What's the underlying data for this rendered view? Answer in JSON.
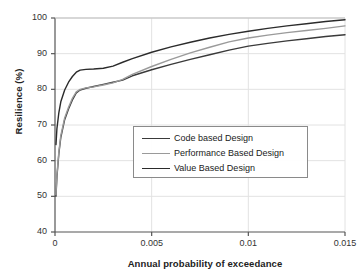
{
  "chart_data": {
    "type": "line",
    "title": "",
    "xlabel": "Annual probability of exceedance",
    "ylabel": "Resilience (%)",
    "xlim": [
      0,
      0.015
    ],
    "ylim": [
      40,
      100
    ],
    "xticks": [
      "0",
      "0.005",
      "0.01",
      "0.015"
    ],
    "xtick_values": [
      0,
      0.005,
      0.01,
      0.015
    ],
    "yticks": [
      "40",
      "50",
      "60",
      "70",
      "80",
      "90",
      "100"
    ],
    "ytick_values": [
      40,
      50,
      60,
      70,
      80,
      90,
      100
    ],
    "grid": true,
    "legend_position": "center",
    "series": [
      {
        "name": "Code based Design",
        "color": "#3a3a3a",
        "x": [
          5e-05,
          0.0001,
          0.0002,
          0.0003,
          0.0005,
          0.0007,
          0.0009,
          0.0011,
          0.0013,
          0.0016,
          0.002,
          0.0025,
          0.003,
          0.0035,
          0.004,
          0.005,
          0.006,
          0.007,
          0.008,
          0.009,
          0.01,
          0.011,
          0.012,
          0.013,
          0.014,
          0.015
        ],
        "y": [
          50.0,
          55.5,
          62.0,
          66.5,
          71.5,
          74.5,
          77.0,
          79.0,
          79.8,
          80.3,
          80.8,
          81.4,
          82.0,
          82.6,
          83.8,
          85.5,
          87.0,
          88.4,
          89.7,
          91.0,
          92.1,
          92.9,
          93.6,
          94.2,
          94.8,
          95.3
        ]
      },
      {
        "name": "Performance Based Design",
        "color": "#9a9a9a",
        "x": [
          5e-05,
          0.0001,
          0.0002,
          0.0003,
          0.0005,
          0.0007,
          0.0009,
          0.0011,
          0.0013,
          0.0016,
          0.002,
          0.0025,
          0.003,
          0.0035,
          0.004,
          0.005,
          0.006,
          0.007,
          0.008,
          0.009,
          0.01,
          0.011,
          0.012,
          0.013,
          0.014,
          0.015
        ],
        "y": [
          50.5,
          56.0,
          62.5,
          67.0,
          72.0,
          75.0,
          77.5,
          79.3,
          80.0,
          80.4,
          80.7,
          81.2,
          81.8,
          82.8,
          84.2,
          86.4,
          88.4,
          90.2,
          91.8,
          93.3,
          94.4,
          95.2,
          95.9,
          96.5,
          97.1,
          97.8
        ]
      },
      {
        "name": "Value Based Design",
        "color": "#2b2b2b",
        "x": [
          5e-05,
          0.0001,
          0.0002,
          0.0003,
          0.0005,
          0.0007,
          0.0009,
          0.0011,
          0.0013,
          0.0016,
          0.002,
          0.0025,
          0.003,
          0.0035,
          0.004,
          0.005,
          0.006,
          0.007,
          0.008,
          0.009,
          0.01,
          0.011,
          0.012,
          0.013,
          0.014,
          0.015
        ],
        "y": [
          64.5,
          69.0,
          73.5,
          76.5,
          79.8,
          82.0,
          83.6,
          84.8,
          85.4,
          85.6,
          85.7,
          85.9,
          86.5,
          87.6,
          88.6,
          90.4,
          91.9,
          93.2,
          94.4,
          95.4,
          96.3,
          97.1,
          97.8,
          98.4,
          99.0,
          99.5
        ]
      }
    ]
  },
  "legend": {
    "items": [
      {
        "label": "Code based Design"
      },
      {
        "label": "Performance Based Design"
      },
      {
        "label": "Value Based Design"
      }
    ]
  },
  "axes": {
    "x_title": "Annual probability of exceedance",
    "y_title": "Resilience (%)"
  }
}
